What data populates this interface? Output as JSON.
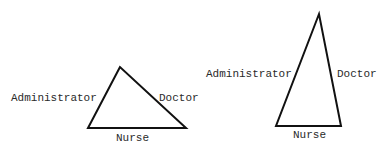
{
  "diagram": {
    "type": "role-triangles",
    "triangles": [
      {
        "id": "left",
        "shape": "broad-triangle",
        "vertices": {
          "apex": [
            120,
            67
          ],
          "bottom_left": [
            88,
            128
          ],
          "bottom_right": [
            186,
            128
          ]
        },
        "labels": {
          "left_side": "Administrator",
          "right_side": "Doctor",
          "base": "Nurse"
        }
      },
      {
        "id": "right",
        "shape": "tall-narrow-triangle",
        "vertices": {
          "apex": [
            319,
            14
          ],
          "bottom_left": [
            276,
            126
          ],
          "bottom_right": [
            341,
            126
          ]
        },
        "labels": {
          "left_side": "Administrator",
          "right_side": "Doctor",
          "base": "Nurse"
        }
      }
    ],
    "colors": {
      "stroke": "#111111",
      "text": "#2a2a2a",
      "background": "#ffffff"
    }
  }
}
